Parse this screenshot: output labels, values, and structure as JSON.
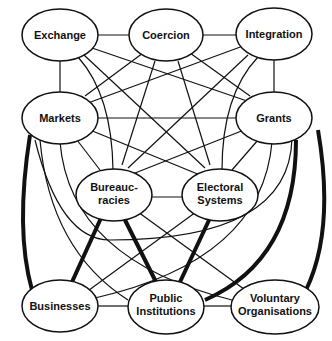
{
  "diagram": {
    "nodes": {
      "exchange": {
        "label": [
          "Exchange"
        ]
      },
      "coercion": {
        "label": [
          "Coercion"
        ]
      },
      "integration": {
        "label": [
          "Integration"
        ]
      },
      "markets": {
        "label": [
          "Markets"
        ]
      },
      "grants": {
        "label": [
          "Grants"
        ]
      },
      "bureaucracies": {
        "label": [
          "Bureauc-",
          "racies"
        ]
      },
      "electoral": {
        "label": [
          "Electoral",
          "Systems"
        ]
      },
      "businesses": {
        "label": [
          "Businesses"
        ]
      },
      "public": {
        "label": [
          "Public",
          "Institutions"
        ]
      },
      "voluntary": {
        "label": [
          "Voluntary",
          "Organisations"
        ]
      }
    },
    "edges_thin": [
      [
        "exchange",
        "coercion"
      ],
      [
        "coercion",
        "integration"
      ],
      [
        "exchange",
        "markets"
      ],
      [
        "integration",
        "grants"
      ],
      [
        "markets",
        "grants"
      ],
      [
        "exchange",
        "grants"
      ],
      [
        "integration",
        "markets"
      ],
      [
        "coercion",
        "markets"
      ],
      [
        "coercion",
        "grants"
      ],
      [
        "exchange",
        "bureaucracies"
      ],
      [
        "exchange",
        "electoral"
      ],
      [
        "coercion",
        "bureaucracies"
      ],
      [
        "coercion",
        "electoral"
      ],
      [
        "integration",
        "bureaucracies"
      ],
      [
        "integration",
        "electoral"
      ],
      [
        "markets",
        "bureaucracies"
      ],
      [
        "markets",
        "electoral"
      ],
      [
        "grants",
        "bureaucracies"
      ],
      [
        "grants",
        "electoral"
      ],
      [
        "bureaucracies",
        "electoral"
      ],
      [
        "bureaucracies",
        "voluntary"
      ],
      [
        "electoral",
        "businesses"
      ],
      [
        "businesses",
        "public"
      ],
      [
        "public",
        "voluntary"
      ],
      [
        "markets",
        "public"
      ],
      [
        "markets",
        "voluntary"
      ],
      [
        "grants",
        "businesses"
      ],
      [
        "grants",
        "public"
      ]
    ],
    "edges_strong": [
      [
        "markets",
        "businesses"
      ],
      [
        "bureaucracies",
        "businesses"
      ],
      [
        "bureaucracies",
        "public"
      ],
      [
        "electoral",
        "public"
      ],
      [
        "grants",
        "public"
      ],
      [
        "grants",
        "voluntary"
      ]
    ]
  }
}
